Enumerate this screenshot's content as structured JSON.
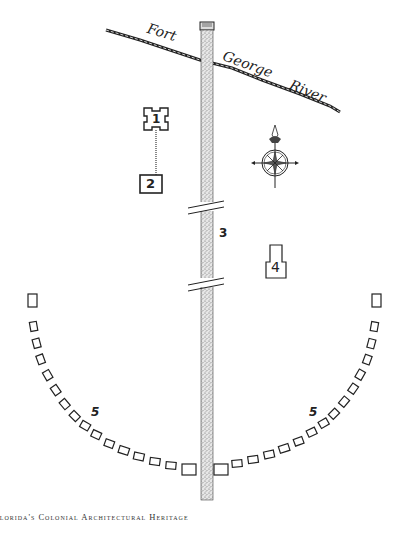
{
  "map": {
    "river": {
      "name_part1": "Fort",
      "name_part2": "George",
      "name_part3": "River"
    },
    "features": [
      {
        "id": 1,
        "label": "1",
        "shape": "bastioned-fort"
      },
      {
        "id": 2,
        "label": "2",
        "shape": "square-building"
      },
      {
        "id": 3,
        "label": "3",
        "shape": "avenue"
      },
      {
        "id": 4,
        "label": "4",
        "shape": "house"
      },
      {
        "id": 5,
        "label": "5",
        "shape": "arc-of-cabins-left"
      },
      {
        "id": 6,
        "label": "5",
        "shape": "arc-of-cabins-right"
      }
    ],
    "compass": {
      "icon": "compass-rose-icon"
    }
  },
  "footer": {
    "running_head": "Florida's Colonial Architectural Heritage"
  },
  "colors": {
    "ink": "#222222",
    "paper": "#ffffff",
    "stipple": "#999999"
  }
}
